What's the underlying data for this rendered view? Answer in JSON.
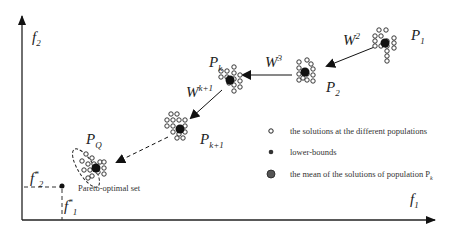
{
  "axes": {
    "y_label": "f",
    "y_sub": "2",
    "x_label": "f",
    "x_sub": "1"
  },
  "populations": [
    {
      "id": "P1",
      "label": "P",
      "sub": "1",
      "cx": 385,
      "cy": 43
    },
    {
      "id": "P2",
      "label": "P",
      "sub": "2",
      "cx": 305,
      "cy": 72
    },
    {
      "id": "Pk",
      "label": "P",
      "sub": "k",
      "cx": 230,
      "cy": 80
    },
    {
      "id": "Pk1",
      "label": "P",
      "sub": "k+1",
      "cx": 180,
      "cy": 129
    },
    {
      "id": "PQ",
      "label": "P",
      "sub": "Q",
      "cx": 96,
      "cy": 168
    }
  ],
  "weights": [
    {
      "label": "W",
      "sup": "2"
    },
    {
      "label": "W",
      "sup": "3"
    },
    {
      "label": "W",
      "sup": "k+1"
    }
  ],
  "ideal_point": {
    "f2_label": "f",
    "f2_sup": "*",
    "f2_sub": "2",
    "f1_label": "f",
    "f1_sup": "*",
    "f1_sub": "1"
  },
  "pareto_label": "Pareto-optimal set",
  "legend": [
    {
      "icon": "hollow-circle-icon",
      "text": "the solutions at the different populations"
    },
    {
      "icon": "small-dot-icon",
      "text": "lower-bounds"
    },
    {
      "icon": "large-dot-icon",
      "text": "the mean of the solutions of population P",
      "sub": "k"
    }
  ],
  "colors": {
    "ink": "#111111",
    "legend_mean": "#555555"
  }
}
